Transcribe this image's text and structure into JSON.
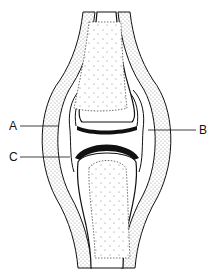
{
  "diagram": {
    "labels": [
      {
        "id": "A",
        "text": "A",
        "x": 10,
        "y": 120
      },
      {
        "id": "B",
        "text": "B",
        "x": 199,
        "y": 125
      },
      {
        "id": "C",
        "text": "C",
        "x": 9,
        "y": 152
      }
    ],
    "colors": {
      "line": "#111111",
      "fill_stipple": "#bbbbbb",
      "background": "#ffffff"
    }
  }
}
